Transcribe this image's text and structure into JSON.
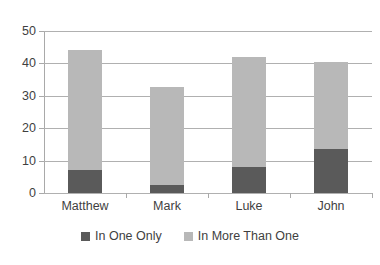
{
  "chart_data": {
    "type": "bar",
    "stacked": true,
    "title": "",
    "subtitle": "",
    "xlabel": "",
    "ylabel": "",
    "categories": [
      "Matthew",
      "Mark",
      "Luke",
      "John"
    ],
    "series": [
      {
        "name": "In One Only",
        "color": "#5a5a5a",
        "values": [
          7.2,
          2.4,
          7.9,
          13.5
        ]
      },
      {
        "name": "In More Than One",
        "color": "#b8b8b8",
        "values": [
          37.0,
          30.3,
          34.1,
          26.8
        ]
      }
    ],
    "totals": [
      44.2,
      32.7,
      42.0,
      40.3
    ],
    "ylim": [
      0,
      50
    ],
    "yticks": [
      0,
      10,
      20,
      30,
      40,
      50
    ],
    "ytick_labels": [
      "0",
      "10",
      "20",
      "30",
      "40",
      "50"
    ],
    "grid": true,
    "grid_axis": "y",
    "legend_position": "bottom",
    "legend": [
      "In One Only",
      "In More Than One"
    ],
    "plot_background": "#ffffff",
    "gridline_color": "#b0b0b0",
    "axis_color": "#a9a9a9",
    "text_color": "#3f3f3f"
  }
}
